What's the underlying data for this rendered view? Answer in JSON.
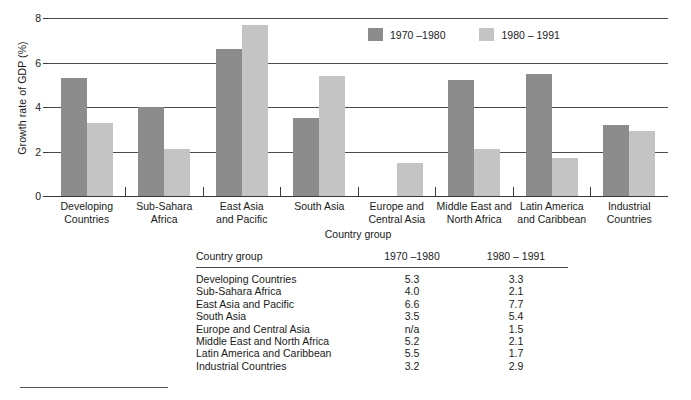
{
  "chart_data": {
    "type": "bar",
    "title": "",
    "xlabel": "Country group",
    "ylabel": "Growth rate of GDP (%)",
    "ylim": [
      0,
      8
    ],
    "yticks": [
      "0",
      "2",
      "4",
      "6",
      "8"
    ],
    "grid": true,
    "legend_position": "top-right",
    "categories": [
      "Developing Countries",
      "Sub-Sahara Africa",
      "East Asia and Pacific",
      "South Asia",
      "Europe and Central Asia",
      "Middle East and North Africa",
      "Latin America and Caribbean",
      "Industrial Countries"
    ],
    "category_lines": [
      [
        "Developing",
        "Countries"
      ],
      [
        "Sub-Sahara",
        "Africa"
      ],
      [
        "East Asia",
        "and Pacific"
      ],
      [
        "South Asia",
        ""
      ],
      [
        "Europe and",
        "Central Asia"
      ],
      [
        "Middle East and",
        "North Africa"
      ],
      [
        "Latin America",
        "and Caribbean"
      ],
      [
        "Industrial",
        "Countries"
      ]
    ],
    "series": [
      {
        "name": "1970 –1980",
        "color": "#8c8c8c",
        "values": [
          5.3,
          4.0,
          6.6,
          3.5,
          null,
          5.2,
          5.5,
          3.2
        ],
        "labels": [
          "5.3",
          "4.0",
          "6.6",
          "3.5",
          "n/a",
          "5.2",
          "5.5",
          "3.2"
        ]
      },
      {
        "name": "1980 – 1991",
        "color": "#c4c4c4",
        "values": [
          3.3,
          2.1,
          7.7,
          5.4,
          1.5,
          2.1,
          1.7,
          2.9
        ],
        "labels": [
          "3.3",
          "2.1",
          "7.7",
          "5.4",
          "1.5",
          "2.1",
          "1.7",
          "2.9"
        ]
      }
    ]
  },
  "legend": {
    "items": [
      {
        "label": "1970 –1980"
      },
      {
        "label": "1980 – 1991"
      }
    ]
  },
  "table": {
    "headers": [
      "Country group",
      "1970 –1980",
      "1980 – 1991"
    ],
    "rows": [
      {
        "group": "Developing  Countries",
        "v1": "5.3",
        "v2": "3.3"
      },
      {
        "group": "Sub-Sahara Africa",
        "v1": "4.0",
        "v2": "2.1"
      },
      {
        "group": "East Asia and Pacific",
        "v1": "6.6",
        "v2": "7.7"
      },
      {
        "group": "South Asia",
        "v1": "3.5",
        "v2": "5.4"
      },
      {
        "group": "Europe and Central Asia",
        "v1": "n/a",
        "v2": "1.5"
      },
      {
        "group": "Middle East and North Africa",
        "v1": "5.2",
        "v2": "2.1"
      },
      {
        "group": "Latin America and Caribbean",
        "v1": "5.5",
        "v2": "1.7"
      },
      {
        "group": "Industrial Countries",
        "v1": "3.2",
        "v2": "2.9"
      }
    ]
  }
}
